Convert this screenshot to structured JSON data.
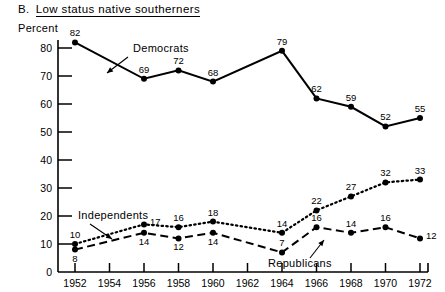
{
  "header": {
    "panel_letter": "B.",
    "panel_title": "Low status native southerners"
  },
  "axis": {
    "ylabel": "Percent",
    "y_ticks": [
      "0",
      "10",
      "20",
      "30",
      "40",
      "50",
      "60",
      "70",
      "80"
    ],
    "x_ticks": [
      "1952",
      "1954",
      "1956",
      "1958",
      "1960",
      "1962",
      "1964",
      "1966",
      "1968",
      "1970",
      "1972"
    ]
  },
  "annotations": [
    {
      "name": "democrats-annotation",
      "text": "Democrats"
    },
    {
      "name": "independents-annotation",
      "text": "Independents"
    },
    {
      "name": "republicans-annotation",
      "text": "Republicans"
    }
  ],
  "chart_data": {
    "type": "line",
    "xlabel": "",
    "ylabel": "Percent",
    "ylim": [
      0,
      80
    ],
    "xlim": [
      1952,
      1972
    ],
    "grid": false,
    "legend": "inline-annotations",
    "x": [
      1952,
      1956,
      1958,
      1960,
      1964,
      1966,
      1968,
      1970,
      1972
    ],
    "x_axis_ticks": [
      1952,
      1954,
      1956,
      1958,
      1960,
      1962,
      1964,
      1966,
      1968,
      1970,
      1972
    ],
    "series": [
      {
        "name": "Democrats",
        "style": "solid",
        "marker": "filled-circle",
        "values": [
          82,
          69,
          72,
          68,
          79,
          62,
          59,
          52,
          55
        ],
        "label_positions": [
          "above",
          "above",
          "above",
          "above",
          "above",
          "above",
          "above",
          "above",
          "above"
        ]
      },
      {
        "name": "Independents",
        "style": "dotted",
        "marker": "filled-circle",
        "values": [
          10,
          17,
          16,
          18,
          14,
          22,
          27,
          32,
          33
        ],
        "label_positions": [
          "above",
          "right",
          "above",
          "above",
          "above",
          "above",
          "above",
          "above",
          "above"
        ]
      },
      {
        "name": "Republicans",
        "style": "dashed",
        "marker": "filled-circle",
        "values": [
          8,
          14,
          12,
          14,
          7,
          16,
          14,
          16,
          12
        ],
        "label_positions": [
          "below",
          "below",
          "below",
          "below",
          "above",
          "above",
          "above",
          "above",
          "right"
        ]
      }
    ]
  }
}
